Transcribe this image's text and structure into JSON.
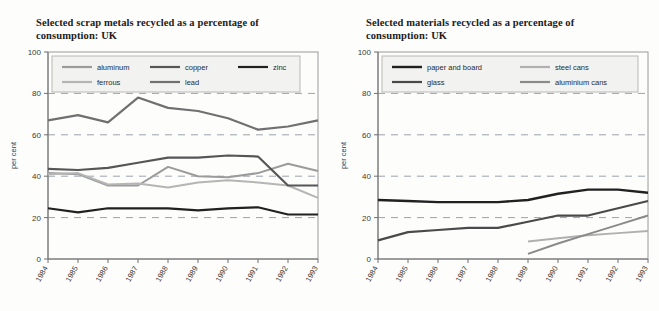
{
  "page": {
    "background": "#fdfdfc",
    "axis_color": "#6e6e6e",
    "grid_color": "#9aa3ad"
  },
  "charts": [
    {
      "id": "scrap-metals",
      "title": "Selected scrap metals recycled as a percentage of consumption: UK",
      "title_line1": "Selected scrap metals recycled as a percentage of",
      "title_line2": "consumption: UK",
      "ylabel": "per cent",
      "xlabel": "",
      "ylim": [
        0,
        100
      ],
      "yticks": [
        0,
        20,
        40,
        60,
        80,
        100
      ],
      "ytick_labels": [
        "0",
        "20",
        "40",
        "60",
        "80",
        "100"
      ],
      "categories": [
        "1984",
        "1985",
        "1986",
        "1987",
        "1988",
        "1989",
        "1990",
        "1991",
        "1992",
        "1993"
      ],
      "grid": "horizontal-dashed",
      "legend_position": "top-inside",
      "series": [
        {
          "name": "aluminum",
          "color": "#9b9b9b",
          "width": 2.0,
          "dash": "none",
          "values": [
            41.5,
            41.0,
            35.5,
            35.5,
            44.5,
            40.0,
            39.5,
            41.5,
            46.0,
            42.5
          ]
        },
        {
          "name": "ferrous",
          "color": "#b5b5b5",
          "width": 2.0,
          "dash": "none",
          "values": [
            41.0,
            41.5,
            36.0,
            36.5,
            34.5,
            37.0,
            38.0,
            37.0,
            35.5,
            29.5
          ]
        },
        {
          "name": "copper",
          "color": "#565656",
          "width": 2.2,
          "dash": "none",
          "values": [
            43.5,
            43.0,
            44.0,
            46.5,
            49.0,
            49.0,
            50.0,
            49.5,
            35.5,
            35.5
          ]
        },
        {
          "name": "lead",
          "color": "#707070",
          "width": 2.2,
          "dash": "none",
          "values": [
            67.0,
            69.5,
            66.0,
            78.0,
            73.0,
            71.5,
            68.0,
            62.5,
            64.0,
            67.0
          ]
        },
        {
          "name": "zinc",
          "color": "#212121",
          "width": 2.2,
          "dash": "none",
          "values": [
            24.5,
            22.5,
            24.5,
            24.5,
            24.5,
            23.5,
            24.5,
            25.0,
            21.5,
            21.5
          ]
        }
      ],
      "legend_rows": [
        [
          "aluminum",
          "copper",
          "zinc"
        ],
        [
          "ferrous",
          "lead"
        ]
      ]
    },
    {
      "id": "materials",
      "title": "Selected materials recycled as a percentage of consumption: UK",
      "title_line1": "Selected materials recycled as a percentage of",
      "title_line2": "consumption: UK",
      "ylabel": "per cent",
      "xlabel": "",
      "ylim": [
        0,
        100
      ],
      "yticks": [
        0,
        20,
        40,
        60,
        80,
        100
      ],
      "ytick_labels": [
        "0",
        "20",
        "40",
        "60",
        "80",
        "100"
      ],
      "categories": [
        "1984",
        "1985",
        "1986",
        "1987",
        "1988",
        "1989",
        "1990",
        "1991",
        "1992",
        "1993"
      ],
      "grid": "horizontal-dashed",
      "legend_position": "top-inside",
      "series": [
        {
          "name": "paper and board",
          "color": "#212121",
          "width": 2.4,
          "dash": "none",
          "values": [
            28.5,
            28.0,
            27.5,
            27.5,
            27.5,
            28.5,
            31.5,
            33.5,
            33.5,
            32.0
          ]
        },
        {
          "name": "glass",
          "color": "#4a4a4a",
          "width": 2.2,
          "dash": "none",
          "values": [
            9.0,
            13.0,
            14.0,
            15.0,
            15.0,
            18.0,
            21.0,
            21.0,
            24.5,
            28.0
          ]
        },
        {
          "name": "steel cans",
          "color": "#b0b0b0",
          "width": 2.0,
          "dash": "none",
          "values": [
            null,
            null,
            null,
            null,
            null,
            8.5,
            10.0,
            11.5,
            12.5,
            13.5
          ]
        },
        {
          "name": "aluminium cans",
          "color": "#8a8a8a",
          "width": 2.0,
          "dash": "none",
          "values": [
            null,
            null,
            null,
            null,
            null,
            2.5,
            7.5,
            12.0,
            16.5,
            21.0
          ]
        }
      ],
      "legend_rows": [
        [
          "paper and board",
          "steel cans"
        ],
        [
          "glass",
          "aluminium cans"
        ]
      ]
    }
  ]
}
